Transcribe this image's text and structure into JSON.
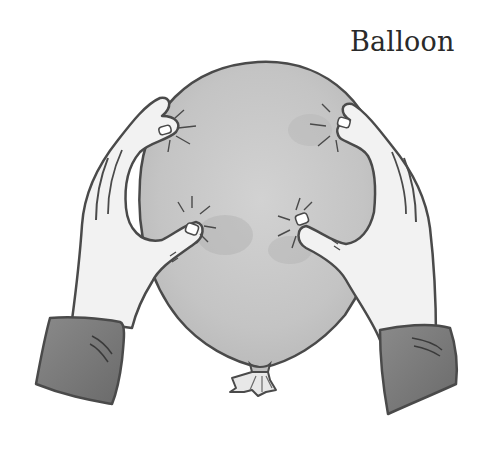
{
  "title": "Balloon",
  "illustration": {
    "subject": "balloon-held-by-two-hands",
    "colors": {
      "balloon_fill": "#c9c9c9",
      "balloon_shade": "#b4b4b4",
      "outline": "#4a4a4a",
      "skin": "#f2f2f2",
      "sleeve": "#7a7a7a",
      "background": "#ffffff"
    }
  }
}
